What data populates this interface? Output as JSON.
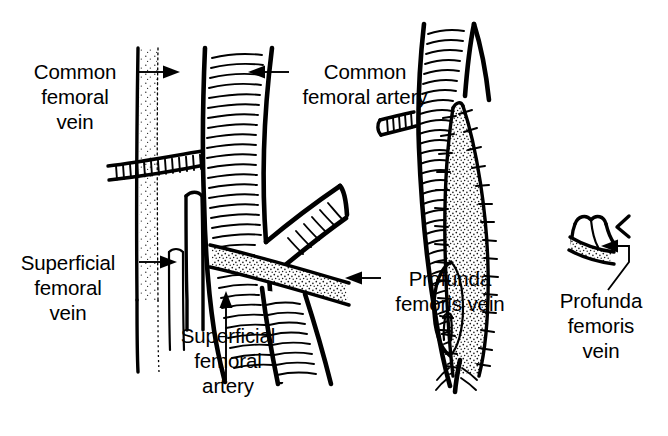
{
  "figure": {
    "background_color": "#ffffff",
    "ink_color": "#000000",
    "panels": [
      {
        "id": "left",
        "name": "normal-anatomy"
      },
      {
        "id": "right",
        "name": "patch-repair"
      }
    ]
  },
  "labels": {
    "common_femoral_vein": {
      "lines": [
        "Common",
        "femoral",
        "vein"
      ],
      "line1": "Common",
      "line2": "femoral",
      "line3": "vein"
    },
    "common_femoral_artery": {
      "lines": [
        "Common",
        "femoral artery"
      ],
      "line1": "Common",
      "line2": "femoral artery"
    },
    "superficial_femoral_vein": {
      "lines": [
        "Superficial",
        "femoral",
        "vein"
      ],
      "line1": "Superficial",
      "line2": "femoral",
      "line3": "vein"
    },
    "superficial_femoral_artery": {
      "lines": [
        "Superficial",
        "femoral",
        "artery"
      ],
      "line1": "Superficial",
      "line2": "femoral",
      "line3": "artery"
    },
    "profunda_femoris_vein_left": {
      "lines": [
        "Profunda",
        "femoris vein"
      ],
      "line1": "Profunda",
      "line2": "femoris vein"
    },
    "profunda_femoris_vein_right": {
      "lines": [
        "Profunda",
        "femoris",
        "vein"
      ],
      "line1": "Profunda",
      "line2": "femoris",
      "line3": "vein"
    }
  }
}
